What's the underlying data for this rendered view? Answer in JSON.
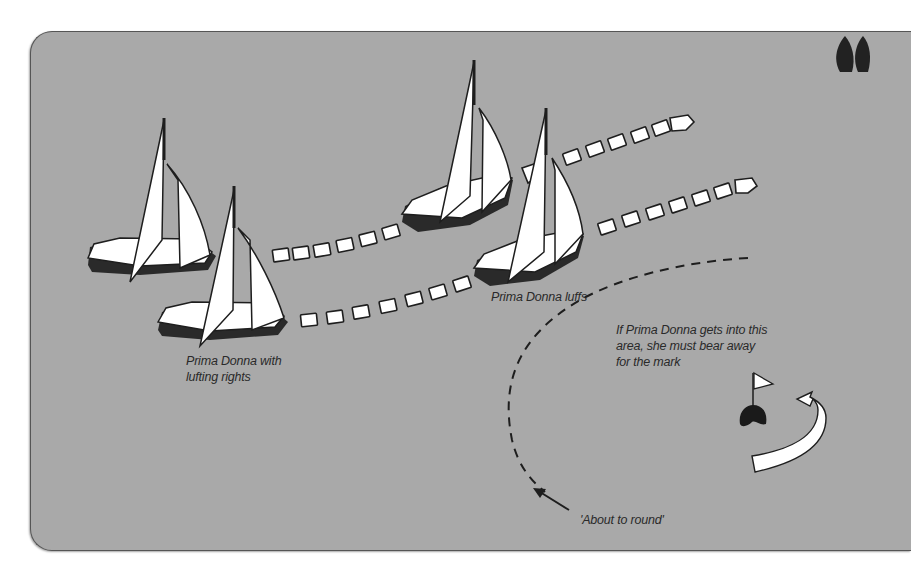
{
  "diagram": {
    "colors": {
      "background": "#a9a9a9",
      "sail": "#ffffff",
      "outline": "#1e1e1e",
      "hull_shadow": "#2a2a2a",
      "mark": "#1a1a1a"
    },
    "labels": {
      "prima_donna_with_rights_line1": "Prima Donna with",
      "prima_donna_with_rights_line2": "lufting rights",
      "prima_donna_luffs": "Prima Donna luffs",
      "bear_away_line1": "If Prima Donna gets into this",
      "bear_away_line2": "area, she must bear away",
      "bear_away_line3": "for the mark",
      "about_to_round": "'About to round'"
    },
    "icons": {
      "quote_mark": "double-quote-icon",
      "mark_buoy": "buoy-with-flag-icon",
      "rounding_arrow": "curved-arrow-icon"
    },
    "boats": [
      {
        "id": "boat-back-left",
        "role": "windward boat, start position"
      },
      {
        "id": "boat-front-left",
        "role": "Prima Donna, start position"
      },
      {
        "id": "boat-back-right",
        "role": "windward boat, after luff"
      },
      {
        "id": "boat-front-right",
        "role": "Prima Donna, luffing"
      }
    ]
  }
}
